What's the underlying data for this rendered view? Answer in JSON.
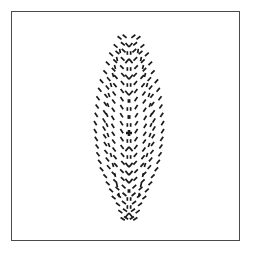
{
  "figure": {
    "description": "A vertically elongated leaf or feather outline rendered entirely from short dark dashes arranged in chevron rows around a central vertical spine of small glyph-like marks.",
    "background_color": "#ffffff",
    "border_color": "#4a4a4a",
    "mark_color": "#1a1a1a",
    "frame": {
      "x": 11,
      "y": 11,
      "width": 229,
      "height": 230,
      "border_width_px": 1.4
    },
    "pattern_bounds": {
      "center_x": 128,
      "top_y": 30,
      "bottom_y": 222,
      "max_half_width": 38
    },
    "mark_style": {
      "dash_length_px": 5.0,
      "dash_thickness_px": 1.7,
      "linecap": "butt"
    },
    "spine": {
      "label": "central-spine",
      "x": 128,
      "glyphs": [
        {
          "y": 44,
          "type": "chevron-down",
          "size": 3.4
        },
        {
          "y": 52,
          "type": "tick-pair",
          "size": 3.0
        },
        {
          "y": 60,
          "type": "chevron-up",
          "size": 3.6
        },
        {
          "y": 68,
          "type": "tick-pair",
          "size": 3.0
        },
        {
          "y": 76,
          "type": "chevron-down",
          "size": 3.8
        },
        {
          "y": 84,
          "type": "tick-pair",
          "size": 3.0
        },
        {
          "y": 92,
          "type": "chevron-down",
          "size": 3.8
        },
        {
          "y": 100,
          "type": "blob",
          "size": 3.2
        },
        {
          "y": 108,
          "type": "tick-pair",
          "size": 3.0
        },
        {
          "y": 116,
          "type": "blob",
          "size": 3.4
        },
        {
          "y": 124,
          "type": "tick-pair",
          "size": 3.0
        },
        {
          "y": 132,
          "type": "cross",
          "size": 4.0
        },
        {
          "y": 140,
          "type": "tick-pair",
          "size": 3.0
        },
        {
          "y": 148,
          "type": "chevron-up",
          "size": 3.6
        },
        {
          "y": 156,
          "type": "tick-pair",
          "size": 3.0
        },
        {
          "y": 164,
          "type": "chevron-down",
          "size": 3.6
        },
        {
          "y": 172,
          "type": "chevron-down",
          "size": 3.6
        },
        {
          "y": 180,
          "type": "chevron-down",
          "size": 3.6
        },
        {
          "y": 190,
          "type": "blob",
          "size": 3.2
        },
        {
          "y": 198,
          "type": "tick-pair",
          "size": 3.0
        },
        {
          "y": 206,
          "type": "tick-pair",
          "size": 3.0
        },
        {
          "y": 214,
          "type": "chevron-up",
          "size": 3.4
        }
      ]
    },
    "chevron_rows": [
      {
        "y": 34,
        "half_width": 12,
        "count": 2,
        "angle_deg": 38
      },
      {
        "y": 41,
        "half_width": 17,
        "count": 2,
        "angle_deg": 40
      },
      {
        "y": 48,
        "half_width": 21,
        "count": 3,
        "angle_deg": 42
      },
      {
        "y": 56,
        "half_width": 25,
        "count": 3,
        "angle_deg": 44
      },
      {
        "y": 64,
        "half_width": 28,
        "count": 3,
        "angle_deg": 46
      },
      {
        "y": 72,
        "half_width": 31,
        "count": 4,
        "angle_deg": 48
      },
      {
        "y": 80,
        "half_width": 33,
        "count": 4,
        "angle_deg": 50
      },
      {
        "y": 88,
        "half_width": 35,
        "count": 4,
        "angle_deg": 52
      },
      {
        "y": 96,
        "half_width": 36,
        "count": 4,
        "angle_deg": 54
      },
      {
        "y": 104,
        "half_width": 37,
        "count": 4,
        "angle_deg": 56
      },
      {
        "y": 112,
        "half_width": 38,
        "count": 4,
        "angle_deg": 58
      },
      {
        "y": 120,
        "half_width": 38,
        "count": 4,
        "angle_deg": 58
      },
      {
        "y": 128,
        "half_width": 37,
        "count": 4,
        "angle_deg": 56
      },
      {
        "y": 136,
        "half_width": 36,
        "count": 4,
        "angle_deg": 54
      },
      {
        "y": 144,
        "half_width": 35,
        "count": 4,
        "angle_deg": 52
      },
      {
        "y": 152,
        "half_width": 33,
        "count": 4,
        "angle_deg": 50
      },
      {
        "y": 160,
        "half_width": 31,
        "count": 4,
        "angle_deg": 48
      },
      {
        "y": 168,
        "half_width": 28,
        "count": 3,
        "angle_deg": 46
      },
      {
        "y": 176,
        "half_width": 25,
        "count": 3,
        "angle_deg": 44
      },
      {
        "y": 184,
        "half_width": 21,
        "count": 3,
        "angle_deg": 42
      },
      {
        "y": 192,
        "half_width": 18,
        "count": 3,
        "angle_deg": 40
      },
      {
        "y": 200,
        "half_width": 14,
        "count": 2,
        "angle_deg": 38
      },
      {
        "y": 208,
        "half_width": 11,
        "count": 2,
        "angle_deg": 36
      },
      {
        "y": 216,
        "half_width": 8,
        "count": 2,
        "angle_deg": 34
      }
    ],
    "arc_dashes": [
      {
        "y": 50,
        "x_offset": 9,
        "angle_deg": 80
      },
      {
        "y": 58,
        "x_offset": 12,
        "angle_deg": 78
      },
      {
        "y": 66,
        "x_offset": 14,
        "angle_deg": 76
      },
      {
        "y": 74,
        "x_offset": 16,
        "angle_deg": 74
      },
      {
        "y": 84,
        "x_offset": 18,
        "angle_deg": 72
      },
      {
        "y": 94,
        "x_offset": 20,
        "angle_deg": 70
      },
      {
        "y": 104,
        "x_offset": 21,
        "angle_deg": 68
      },
      {
        "y": 114,
        "x_offset": 22,
        "angle_deg": 66
      },
      {
        "y": 124,
        "x_offset": 22,
        "angle_deg": 66
      },
      {
        "y": 134,
        "x_offset": 21,
        "angle_deg": 68
      },
      {
        "y": 144,
        "x_offset": 20,
        "angle_deg": 70
      },
      {
        "y": 154,
        "x_offset": 18,
        "angle_deg": 72
      },
      {
        "y": 164,
        "x_offset": 16,
        "angle_deg": 74
      },
      {
        "y": 174,
        "x_offset": 14,
        "angle_deg": 76
      },
      {
        "y": 184,
        "x_offset": 12,
        "angle_deg": 78
      },
      {
        "y": 194,
        "x_offset": 10,
        "angle_deg": 80
      }
    ]
  }
}
